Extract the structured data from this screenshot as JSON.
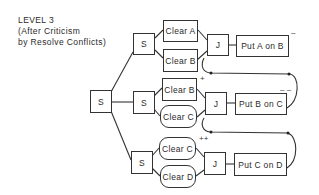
{
  "title": {
    "line1": "LEVEL 3",
    "line2": "(After Criticism",
    "line3": "by Resolve Conflicts)"
  },
  "nodes": {
    "root_split": "S",
    "split_a": "S",
    "split_b": "S",
    "split_c": "S",
    "clear_a": "Clear A",
    "clear_b_top": "Clear B",
    "join_a": "J",
    "put_a_on_b": "Put A on B",
    "clear_b_mid": "Clear B",
    "clear_c_mid": "Clear C",
    "join_b": "J",
    "put_b_on_c": "Put B on C",
    "clear_c_bot": "Clear C",
    "clear_d": "Clear D",
    "join_c": "J",
    "put_c_on_d": "Put C on D"
  },
  "marks": {
    "put_a_on_b": "–",
    "put_b_on_c": "– –",
    "clear_b_mid": "+",
    "clear_c_bot": "++"
  },
  "colors": {
    "line": "#333333",
    "background": "#ffffff"
  }
}
